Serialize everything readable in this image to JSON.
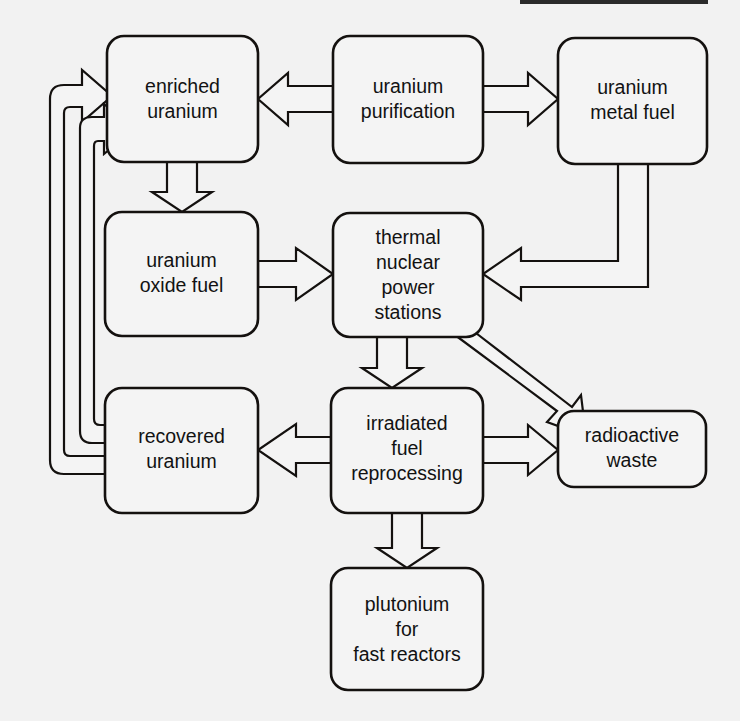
{
  "diagram": {
    "background_color": "#f2f2f2",
    "line_color": "#14110f",
    "box_fill_color": "#f4f4f4",
    "arrow_style": "hollow-outline-block-arrow",
    "nodes": [
      {
        "id": "enriched-uranium",
        "label_lines": [
          "enriched",
          "uranium"
        ],
        "line1": "enriched",
        "line2": "uranium",
        "x": 107,
        "y": 36,
        "w": 151,
        "h": 126
      },
      {
        "id": "uranium-purification",
        "label_lines": [
          "uranium",
          "purification"
        ],
        "line1": "uranium",
        "line2": "purification",
        "x": 333,
        "y": 36,
        "w": 150,
        "h": 127
      },
      {
        "id": "uranium-metal-fuel",
        "label_lines": [
          "uranium",
          "metal fuel"
        ],
        "line1": "uranium",
        "line2": "metal fuel",
        "x": 558,
        "y": 38,
        "w": 149,
        "h": 126
      },
      {
        "id": "uranium-oxide-fuel",
        "label_lines": [
          "uranium",
          "oxide fuel"
        ],
        "line1": "uranium",
        "line2": "oxide fuel",
        "x": 105,
        "y": 212,
        "w": 153,
        "h": 124
      },
      {
        "id": "thermal-nuclear-power-stations",
        "label_lines": [
          "thermal",
          "nuclear",
          "power",
          "stations"
        ],
        "line1": "thermal",
        "line2": "nuclear",
        "line3": "power",
        "line4": "stations",
        "x": 333,
        "y": 213,
        "w": 150,
        "h": 124
      },
      {
        "id": "recovered-uranium",
        "label_lines": [
          "recovered",
          "uranium"
        ],
        "line1": "recovered",
        "line2": "uranium",
        "x": 105,
        "y": 388,
        "w": 153,
        "h": 125
      },
      {
        "id": "irradiated-fuel-reprocessing",
        "label_lines": [
          "irradiated",
          "fuel",
          "reprocessing"
        ],
        "line1": "irradiated",
        "line2": "fuel",
        "line3": "reprocessing",
        "x": 331,
        "y": 388,
        "w": 152,
        "h": 125
      },
      {
        "id": "radioactive-waste",
        "label_lines": [
          "radioactive",
          "waste"
        ],
        "line1": "radioactive",
        "line2": "waste",
        "x": 558,
        "y": 411,
        "w": 148,
        "h": 76
      },
      {
        "id": "plutonium-for-fast-reactors",
        "label_lines": [
          "plutonium",
          "for",
          "fast reactors"
        ],
        "line1": "plutonium",
        "line2": "for",
        "line3": "fast reactors",
        "x": 331,
        "y": 568,
        "w": 152,
        "h": 122
      }
    ],
    "edges": [
      {
        "id": "purification-to-enriched",
        "from": "uranium-purification",
        "to": "enriched-uranium",
        "direction": "left"
      },
      {
        "id": "purification-to-metal-fuel",
        "from": "uranium-purification",
        "to": "uranium-metal-fuel",
        "direction": "right"
      },
      {
        "id": "enriched-to-oxide-fuel",
        "from": "enriched-uranium",
        "to": "uranium-oxide-fuel",
        "direction": "down"
      },
      {
        "id": "oxide-fuel-to-thermal",
        "from": "uranium-oxide-fuel",
        "to": "thermal-nuclear-power-stations",
        "direction": "right"
      },
      {
        "id": "metal-fuel-to-thermal",
        "from": "uranium-metal-fuel",
        "to": "thermal-nuclear-power-stations",
        "direction": "down-left"
      },
      {
        "id": "thermal-to-irradiated",
        "from": "thermal-nuclear-power-stations",
        "to": "irradiated-fuel-reprocessing",
        "direction": "down"
      },
      {
        "id": "thermal-to-radioactive-waste",
        "from": "thermal-nuclear-power-stations",
        "to": "radioactive-waste",
        "direction": "diagonal-down-right"
      },
      {
        "id": "irradiated-to-recovered",
        "from": "irradiated-fuel-reprocessing",
        "to": "recovered-uranium",
        "direction": "left"
      },
      {
        "id": "irradiated-to-radioactive-waste",
        "from": "irradiated-fuel-reprocessing",
        "to": "radioactive-waste",
        "direction": "right"
      },
      {
        "id": "irradiated-to-plutonium",
        "from": "irradiated-fuel-reprocessing",
        "to": "plutonium-for-fast-reactors",
        "direction": "down"
      },
      {
        "id": "recovered-to-enriched-outer",
        "from": "recovered-uranium",
        "to": "enriched-uranium",
        "direction": "feedback-loop-outer"
      },
      {
        "id": "recovered-to-enriched-inner",
        "from": "recovered-uranium",
        "to": "enriched-uranium",
        "direction": "feedback-loop-inner"
      }
    ]
  }
}
